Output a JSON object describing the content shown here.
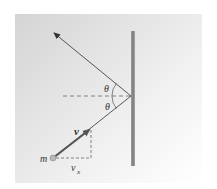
{
  "diagram": {
    "labels": {
      "theta_upper": "θ",
      "theta_lower": "θ",
      "velocity": "v",
      "mass": "m",
      "vx_base": "v",
      "vx_sub": "x"
    },
    "colors": {
      "wall": "#8a8a8a",
      "line": "#444444",
      "vector": "#555555",
      "dashed": "#666666",
      "particle": "#b5b5b5"
    },
    "geometry": {
      "reflection_point": [
        132,
        96
      ],
      "outgoing_tip": [
        53,
        32
      ],
      "particle": [
        53,
        158
      ],
      "velocity_tip": [
        90,
        130
      ]
    }
  }
}
